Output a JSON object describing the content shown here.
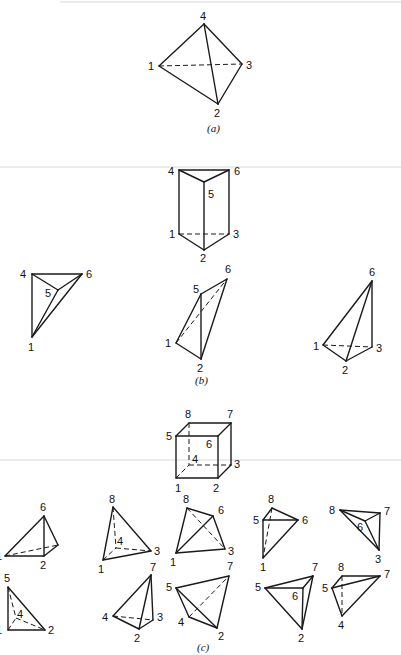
{
  "figure": {
    "parts": [
      {
        "id": "a",
        "caption": "(a)",
        "description": "Tetrahedron",
        "labels": {
          "n1": "1",
          "n2": "2",
          "n3": "3",
          "n4": "4"
        }
      },
      {
        "id": "b",
        "caption": "(b)",
        "description": "Triangular prism decomposed into three tetrahedra",
        "prism_labels": {
          "n1": "1",
          "n2": "2",
          "n3": "3",
          "n4": "4",
          "n5": "5",
          "n6": "6"
        },
        "tetra1_labels": {
          "n4": "4",
          "n5": "5",
          "n6": "6",
          "n1": "1"
        },
        "tetra2_labels": {
          "n5": "5",
          "n6": "6",
          "n1": "1",
          "n2": "2"
        },
        "tetra3_labels": {
          "n6": "6",
          "n1": "1",
          "n2": "2",
          "n3": "3"
        }
      },
      {
        "id": "c",
        "caption": "(c)",
        "description": "Cube (hexahedron) decomposed into tetrahedra",
        "cube_labels": {
          "n1": "1",
          "n2": "2",
          "n3": "3",
          "n4": "4",
          "n5": "5",
          "n6": "6",
          "n7": "7",
          "n8": "8"
        },
        "row1": [
          {
            "labels": {
              "a": "6",
              "b": "1",
              "c": "2"
            }
          },
          {
            "labels": {
              "a": "8",
              "b": "4",
              "c": "1",
              "d": "3"
            }
          },
          {
            "labels": {
              "a": "8",
              "b": "6",
              "c": "1",
              "d": "3"
            }
          },
          {
            "labels": {
              "a": "8",
              "b": "5",
              "c": "6",
              "d": "1"
            }
          },
          {
            "labels": {
              "a": "8",
              "b": "7",
              "c": "6",
              "d": "3"
            }
          }
        ],
        "row2": [
          {
            "labels": {
              "a": "5",
              "b": "4",
              "c": "1",
              "d": "2"
            }
          },
          {
            "labels": {
              "a": "7",
              "b": "4",
              "c": "3",
              "d": "2"
            }
          },
          {
            "labels": {
              "a": "7",
              "b": "5",
              "c": "4",
              "d": "2"
            }
          },
          {
            "labels": {
              "a": "7",
              "b": "5",
              "c": "6",
              "d": "2"
            }
          },
          {
            "labels": {
              "a": "8",
              "b": "7",
              "c": "5",
              "d": "4"
            }
          }
        ]
      }
    ]
  }
}
